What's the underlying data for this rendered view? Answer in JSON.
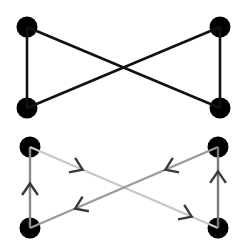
{
  "diagram": {
    "type": "graph",
    "graphs": [
      {
        "name": "undirected-bowtie",
        "directed": false,
        "nodes": [
          {
            "id": "A",
            "x": 27,
            "y": 27
          },
          {
            "id": "B",
            "x": 220,
            "y": 27
          },
          {
            "id": "C",
            "x": 27,
            "y": 108
          },
          {
            "id": "D",
            "x": 220,
            "y": 108
          }
        ],
        "edges": [
          {
            "from": "A",
            "to": "C",
            "color": "#111111"
          },
          {
            "from": "A",
            "to": "D",
            "color": "#111111"
          },
          {
            "from": "C",
            "to": "B",
            "color": "#111111"
          },
          {
            "from": "B",
            "to": "D",
            "color": "#111111"
          }
        ]
      },
      {
        "name": "directed-bowtie",
        "directed": true,
        "nodes": [
          {
            "id": "A",
            "x": 30,
            "y": 147
          },
          {
            "id": "B",
            "x": 218,
            "y": 147
          },
          {
            "id": "C",
            "x": 30,
            "y": 228
          },
          {
            "id": "D",
            "x": 218,
            "y": 228
          }
        ],
        "edges": [
          {
            "from": "C",
            "to": "A",
            "color": "#8a8a8a",
            "arrows": [
              0.55
            ]
          },
          {
            "from": "A",
            "to": "D",
            "color": "#c8c8c8",
            "arrows": [
              0.28,
              0.86
            ]
          },
          {
            "from": "B",
            "to": "C",
            "color": "#9a9a9a",
            "arrows": [
              0.28,
              0.76
            ]
          },
          {
            "from": "D",
            "to": "B",
            "color": "#7a7a7a",
            "arrows": [
              0.7
            ]
          }
        ]
      }
    ],
    "colors": {
      "node": "#000000",
      "arrowhead": "#3a3a3a",
      "background": "#ffffff"
    }
  }
}
